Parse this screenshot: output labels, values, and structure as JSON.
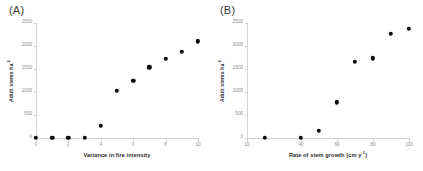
{
  "figure": {
    "panels": [
      {
        "label": "(A)",
        "name": "panel-a"
      },
      {
        "label": "(B)",
        "name": "panel-b"
      }
    ]
  },
  "chart_data": [
    {
      "type": "scatter",
      "panel": "(A)",
      "title": "",
      "xlabel": "Variance in fire intensity",
      "ylabel": "Adult stems ha⁻¹",
      "ylabel_base": "Adult stems ha",
      "ylabel_sup": "-1",
      "xlim": [
        0,
        10
      ],
      "ylim": [
        0,
        2500
      ],
      "xticks": [
        0,
        2,
        4,
        6,
        8,
        10
      ],
      "xticklabels": [
        "0",
        "2",
        "4",
        "6",
        "8",
        "10"
      ],
      "yticks": [
        0,
        500,
        1000,
        1500,
        2000,
        2500
      ],
      "yticklabels": [
        "0",
        "500",
        "1000",
        "1500",
        "2000",
        "2500"
      ],
      "grid": false,
      "legend": "none",
      "x": [
        0,
        1,
        2,
        3,
        4,
        5,
        6,
        7,
        8,
        9,
        10
      ],
      "y": [
        0,
        0,
        0,
        0,
        270,
        1020,
        1250,
        1540,
        1720,
        1880,
        2100
      ]
    },
    {
      "type": "scatter",
      "panel": "(B)",
      "title": "",
      "xlabel": "Rate of stem growth (cm y⁻¹)",
      "xlabel_base": "Rate of stem growth (cm y",
      "xlabel_sup": "-1",
      "xlabel_tail": ")",
      "ylabel": "Adult stems ha⁻¹",
      "ylabel_base": "Adult stems ha",
      "ylabel_sup": "-1",
      "xlim": [
        10,
        100
      ],
      "ylim": [
        0,
        2500
      ],
      "xticks": [
        10,
        40,
        60,
        80,
        100
      ],
      "xticklabels": [
        "10",
        "40",
        "60",
        "80",
        "100"
      ],
      "yticks": [
        0,
        500,
        1000,
        1500,
        2000,
        2500
      ],
      "yticklabels": [
        "0",
        "500",
        "1000",
        "1500",
        "2000",
        "2500"
      ],
      "grid": false,
      "legend": "none",
      "x": [
        20,
        40,
        50,
        60,
        70,
        80,
        90,
        100
      ],
      "y": [
        0,
        0,
        150,
        780,
        1650,
        1730,
        2260,
        2380
      ]
    }
  ],
  "colors": {
    "marker": "#0a0a0a",
    "axis": "#d4d4d4",
    "tick_text": "#8a8a8a",
    "axis_title": "#2b2b2b",
    "panel_label": "#3a3a3a",
    "background": "#ffffff"
  }
}
